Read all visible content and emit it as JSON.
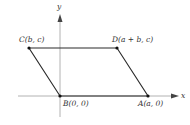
{
  "diagram": {
    "type": "coordinate-parallelogram",
    "axes": {
      "x_label": "x",
      "y_label": "y",
      "color": "#9a9a9a"
    },
    "shape_color": "#2a2a2a",
    "points": [
      {
        "name": "C",
        "label": "C(b, c)",
        "px": 29,
        "py": 48
      },
      {
        "name": "D",
        "label": "D(a + b, c)",
        "px": 117,
        "py": 48
      },
      {
        "name": "B",
        "label": "B(0, 0)",
        "px": 60,
        "py": 96
      },
      {
        "name": "A",
        "label": "A(a, 0)",
        "px": 148,
        "py": 96
      }
    ]
  }
}
